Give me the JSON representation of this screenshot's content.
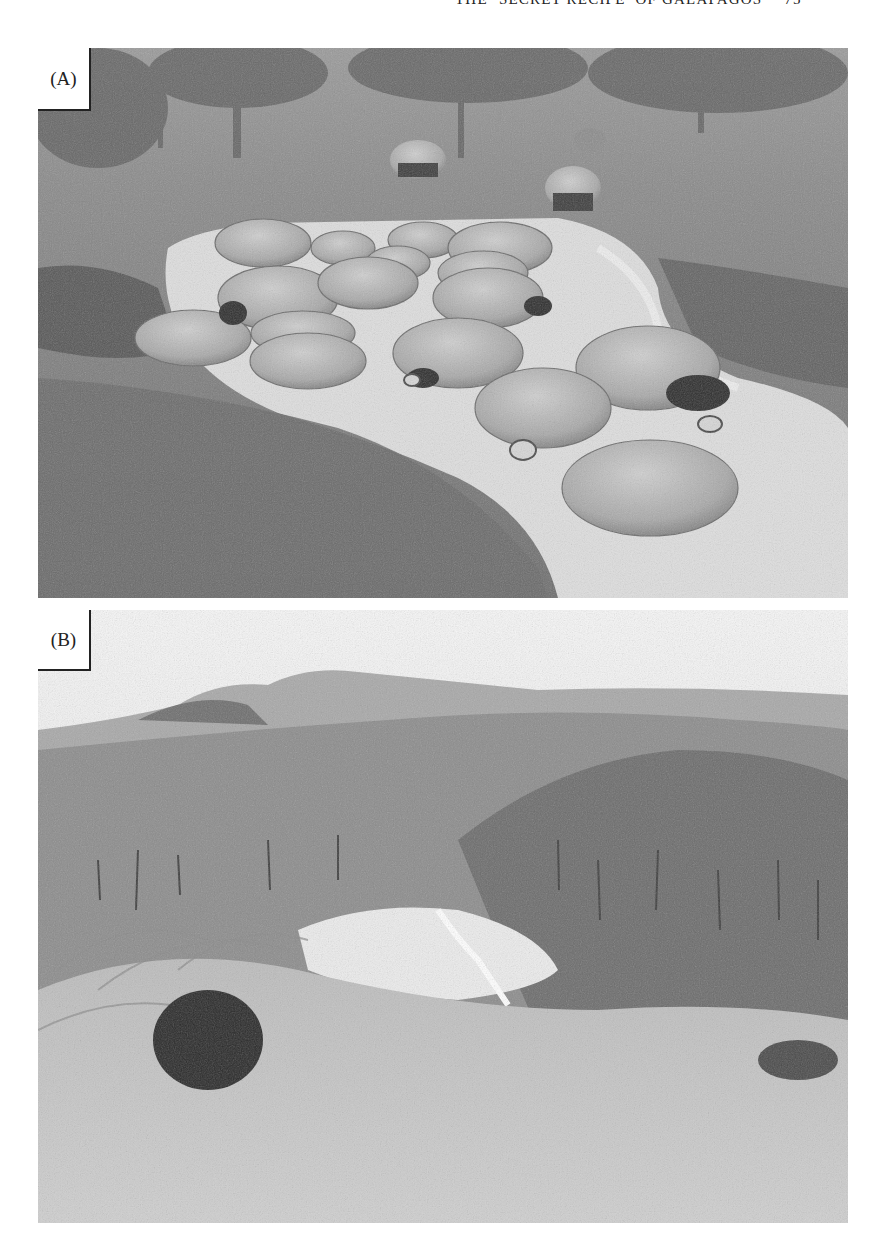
{
  "header": {
    "title": "THE ‘SECRET RECIPE’ OF GALAPAGOS",
    "page_number": "75"
  },
  "figures": [
    {
      "label": "(A)",
      "description": "Grayscale photograph of giant Galapagos tortoises wallowing in a shallow muddy pond surrounded by grass, with trees and more tortoises in the background",
      "colors": {
        "grass": "#7a7a7a",
        "water": "#e4e4e4",
        "shell": "#b4b4b4",
        "trees": "#6a6a6a"
      }
    },
    {
      "label": "(B)",
      "description": "Grayscale photograph of a highland landscape: forested volcanic hills under a hazy sky, a bright wet pond in the middle ground, and ferns in the foreground",
      "colors": {
        "sky": "#efefef",
        "hills": "#8a8a8a",
        "forest": "#7c7c7c",
        "pond": "#f2f2f2",
        "ferns": "#bdbdbd"
      }
    }
  ]
}
